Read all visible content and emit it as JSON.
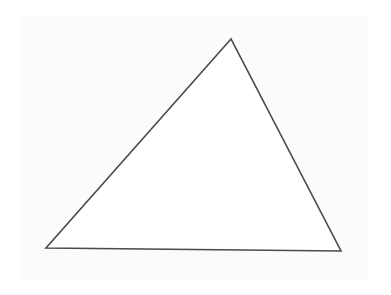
{
  "diagram": {
    "shape": "triangle",
    "vertices": [
      [
        231,
        39
      ],
      [
        46,
        248
      ],
      [
        341,
        251
      ]
    ],
    "stroke_color": "#4a4a4a",
    "stroke_width": 1.6,
    "fill": "#ffffff",
    "background": "#fbfbfb"
  }
}
